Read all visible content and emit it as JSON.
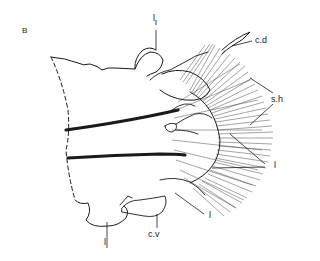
{
  "figure": {
    "panel_label": "B",
    "labels": {
      "cd": "c.d",
      "sh": "s.h",
      "l_top": "l",
      "l_right": "l",
      "l_lower": "l",
      "l_bottom": "l",
      "cv": "c.v"
    },
    "colors": {
      "ink": "#1a1a1a",
      "background": "#ffffff"
    }
  }
}
